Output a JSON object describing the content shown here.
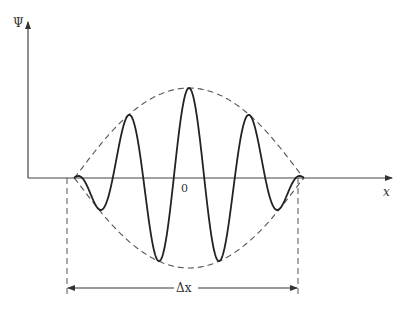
{
  "diagram": {
    "y_axis_label": "Ψ",
    "x_axis_label": "x",
    "origin_label": "0",
    "width_label": "Δx",
    "colors": {
      "background": "#ffffff",
      "curve": "#222222",
      "envelope": "#555555",
      "axes": "#444444"
    },
    "wave": {
      "center_x": 189,
      "baseline_y": 178,
      "peak_amplitude": 90,
      "half_width": 115,
      "wavelength": 61
    }
  }
}
